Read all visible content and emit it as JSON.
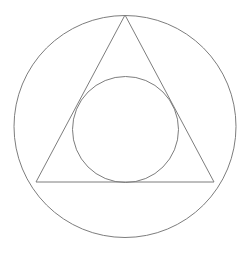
{
  "figure": {
    "title": "Circle with inscribed triangle and inscribed circle",
    "canvas": {
      "width": 251,
      "height": 254,
      "background_color": "#ffffff"
    },
    "style": {
      "stroke_color": "#808080",
      "stroke_width": 1,
      "fill": "none"
    },
    "shapes": [
      {
        "name": "outer-circle",
        "type": "circle",
        "cx": 125,
        "cy": 126.5,
        "r": 111,
        "stroke_color": "#7d7d7d",
        "stroke_width": 1,
        "fill": "none",
        "description": "Large outer circumscribed circle"
      },
      {
        "name": "triangle",
        "type": "polygon",
        "points": "125,15 214,182 36,182",
        "vertices": [
          {
            "label": "apex",
            "x": 125,
            "y": 15
          },
          {
            "label": "bottom-right",
            "x": 214,
            "y": 182
          },
          {
            "label": "bottom-left",
            "x": 36,
            "y": 182
          }
        ],
        "stroke_color": "#7d7d7d",
        "stroke_width": 1,
        "fill": "none",
        "description": "Triangle inscribed in the outer circle"
      },
      {
        "name": "inner-circle",
        "type": "circle",
        "cx": 125.5,
        "cy": 129.5,
        "r": 53,
        "stroke_color": "#7d7d7d",
        "stroke_width": 1,
        "fill": "none",
        "description": "Small circle inscribed in the triangle"
      }
    ]
  }
}
